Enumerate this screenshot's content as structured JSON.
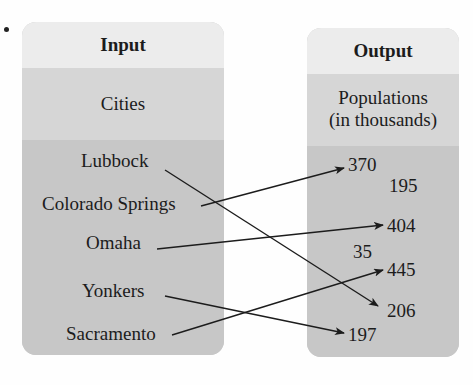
{
  "input": {
    "header": "Input",
    "subheader": "Cities",
    "items": [
      "Lubbock",
      "Colorado Springs",
      "Omaha",
      "Yonkers",
      "Sacramento"
    ]
  },
  "output": {
    "header": "Output",
    "subheader_line1": "Populations",
    "subheader_line2": "(in thousands)",
    "items": [
      "370",
      "195",
      "404",
      "35",
      "445",
      "206",
      "197"
    ]
  },
  "mapping": [
    {
      "from": "Lubbock",
      "to": "206"
    },
    {
      "from": "Colorado Springs",
      "to": "370"
    },
    {
      "from": "Omaha",
      "to": "404"
    },
    {
      "from": "Yonkers",
      "to": "197"
    },
    {
      "from": "Sacramento",
      "to": "445"
    }
  ],
  "colors": {
    "header_bg": "#ececec",
    "subheader_bg": "#d6d6d6",
    "body_bg": "#c7c7c7",
    "arrow": "#1c1c1c"
  }
}
